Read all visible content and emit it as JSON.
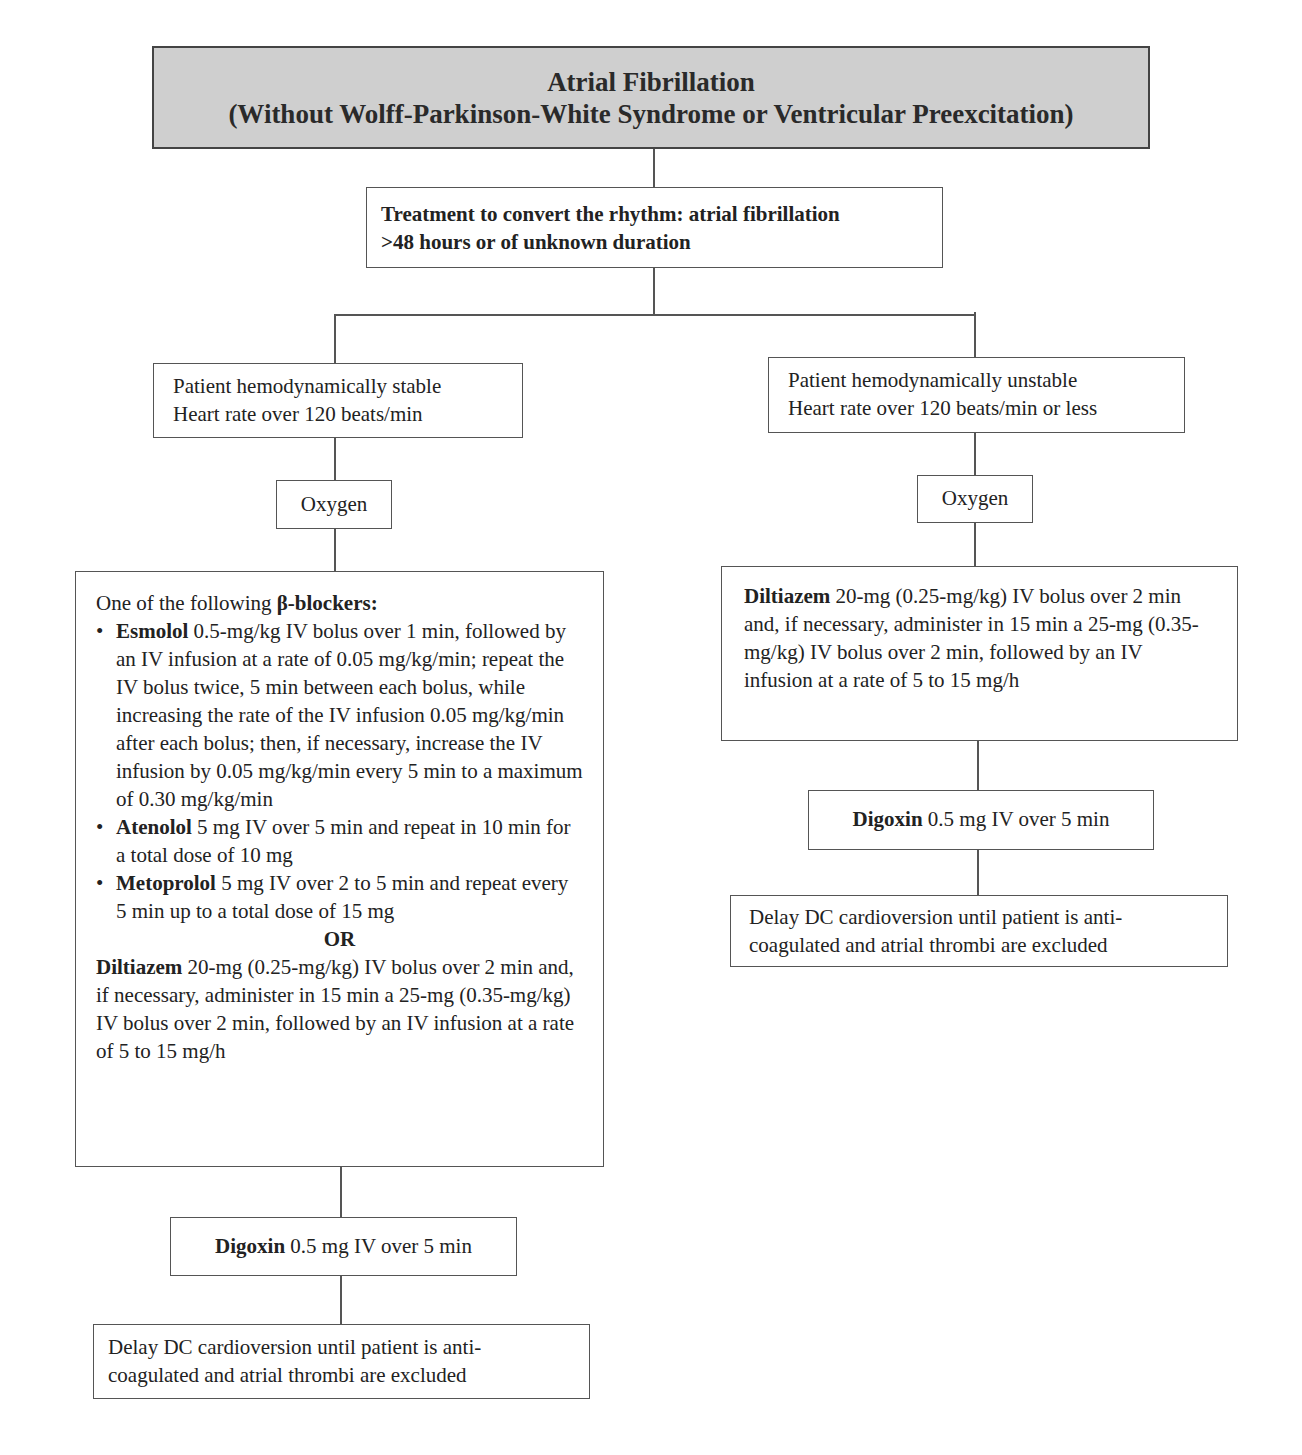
{
  "title": {
    "line1": "Atrial Fibrillation",
    "line2": "(Without Wolff-Parkinson-White Syndrome or Ventricular Preexcitation)",
    "fill_color": "#cfcfcf"
  },
  "treatment": {
    "line1": "Treatment to convert the rhythm: atrial fibrillation",
    "line2": ">48 hours or of unknown duration"
  },
  "left_branch": {
    "condition": {
      "line1": "Patient hemodynamically stable",
      "line2": "Heart rate over 120 beats/min"
    },
    "oxygen": "Oxygen",
    "drugs": {
      "intro": "One of the following ",
      "intro_bold": "β-blockers:",
      "bullet_glyph": "•",
      "items": [
        {
          "name": "Esmolol",
          "text": " 0.5-mg/kg IV bolus over 1 min, followed by an IV infusion at a rate of 0.05 mg/kg/min; repeat the IV bolus twice, 5 min between each bolus, while increasing the rate of the IV infusion 0.05 mg/kg/min after each bolus; then, if necessary, increase the IV infusion by 0.05 mg/kg/min every 5 min to a maximum of 0.30 mg/kg/min"
        },
        {
          "name": "Atenolol",
          "text": " 5 mg IV over 5 min and repeat in 10 min for a total dose of 10 mg"
        },
        {
          "name": "Metoprolol",
          "text": " 5 mg IV over 2 to 5 min and repeat every 5 min up to a total dose of 15 mg"
        }
      ],
      "or_label": "OR",
      "alt_name": "Diltiazem",
      "alt_text": " 20-mg (0.25-mg/kg) IV bolus over 2 min and, if necessary, administer in 15 min a 25-mg (0.35-mg/kg) IV bolus over 2 min, followed by an IV infusion at a rate of 5 to 15 mg/h"
    },
    "digoxin": {
      "name": "Digoxin",
      "text": " 0.5 mg IV over 5 min"
    },
    "delay": {
      "line1": "Delay DC cardioversion until patient is anti-",
      "line2": "coagulated and atrial thrombi are excluded"
    }
  },
  "right_branch": {
    "condition": {
      "line1": "Patient hemodynamically unstable",
      "line2": "Heart rate over 120 beats/min or less"
    },
    "oxygen": "Oxygen",
    "drug": {
      "name": "Diltiazem",
      "text": " 20-mg (0.25-mg/kg) IV bolus over 2 min and, if necessary, administer in 15 min a 25-mg (0.35-mg/kg) IV bolus over 2 min, followed by an IV infusion at a rate of 5 to 15 mg/h"
    },
    "digoxin": {
      "name": "Digoxin",
      "text": " 0.5 mg IV over 5 min"
    },
    "delay": {
      "line1": "Delay DC cardioversion until patient is anti-",
      "line2": "coagulated and atrial thrombi are excluded"
    }
  }
}
